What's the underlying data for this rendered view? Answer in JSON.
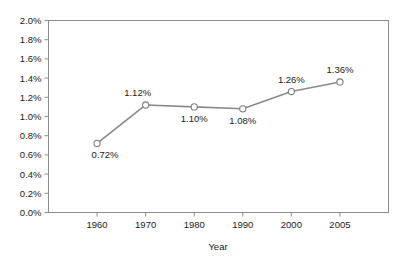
{
  "chart_data": {
    "type": "line",
    "title": "",
    "xlabel": "Year",
    "ylabel": "",
    "categories": [
      "1960",
      "1970",
      "1980",
      "1990",
      "2000",
      "2005"
    ],
    "values": [
      0.72,
      1.12,
      1.1,
      1.08,
      1.26,
      1.36
    ],
    "point_labels": [
      "0.72%",
      "1.12%",
      "1.10%",
      "1.08%",
      "1.26%",
      "1.36%"
    ],
    "label_positions": [
      "below",
      "above",
      "below",
      "below",
      "above",
      "above"
    ],
    "ylim": [
      0.0,
      2.0
    ],
    "ytick_values": [
      0.0,
      0.2,
      0.4,
      0.6,
      0.8,
      1.0,
      1.2,
      1.4,
      1.6,
      1.8,
      2.0
    ],
    "ytick_labels": [
      "0.0%",
      "0.2%",
      "0.4%",
      "0.6%",
      "0.8%",
      "1.0%",
      "1.2%",
      "1.4%",
      "1.6%",
      "1.8%",
      "2.0%"
    ],
    "grid": false,
    "legend": false,
    "series_name": "",
    "line_color": "#8a8a8a",
    "marker_fill": "#ffffff",
    "marker_stroke": "#7d7d7d",
    "frame_color": "#8c8c8c",
    "text_color": "#1a1a1a",
    "background_color": "#ffffff"
  }
}
